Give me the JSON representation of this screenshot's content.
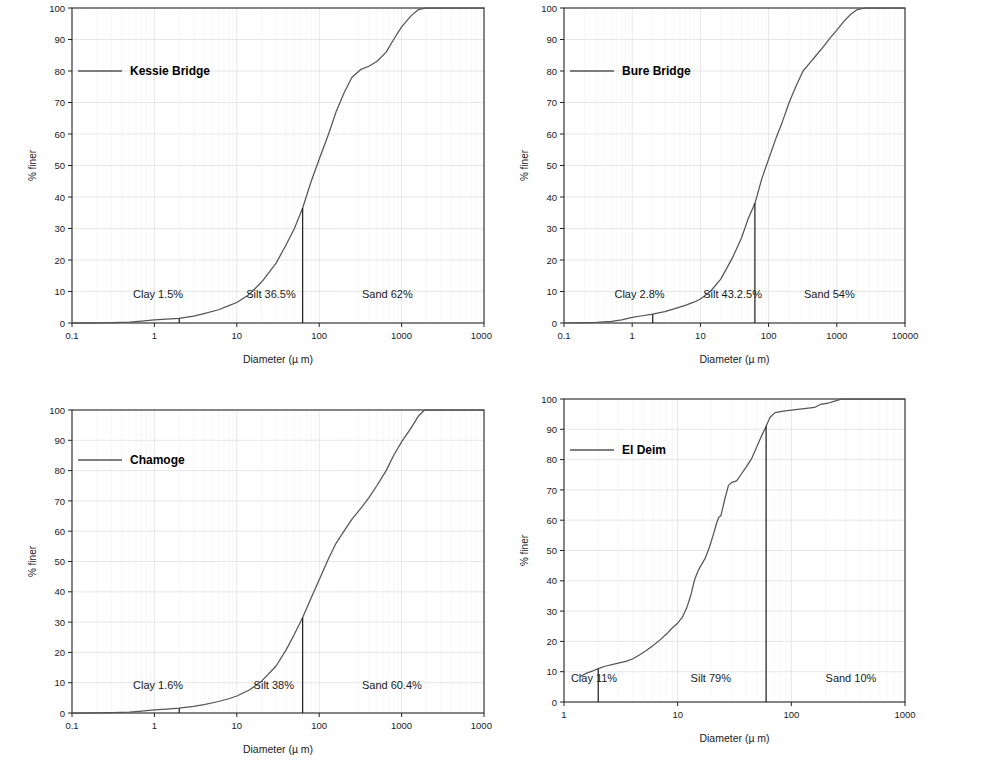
{
  "figure": {
    "background": "#ffffff",
    "line_color": "#555555",
    "axis_color": "#222222",
    "grid_color": "#dddddd",
    "text_color": "#1a1a1a",
    "panel_count": 4,
    "layout": "2x2"
  },
  "common": {
    "xlabel": "Diameter (µ m)",
    "ylabel": "% finer",
    "yticks": [
      0,
      10,
      20,
      30,
      40,
      50,
      60,
      70,
      80,
      90,
      100
    ],
    "ylim": [
      0,
      100
    ],
    "grid": true,
    "legend_position": "upper-left-inside"
  },
  "chart_data": [
    {
      "type": "line",
      "id": "kessie-bridge",
      "title": "",
      "legend": [
        "Kessie Bridge"
      ],
      "xlabel": "Diameter (µ m)",
      "ylabel": "% finer",
      "xscale": "log",
      "xlim": [
        0.1,
        10000
      ],
      "xticks": [
        0.1,
        1,
        10,
        100,
        1000,
        10000
      ],
      "xticklabels": [
        "0.1",
        "1",
        "10",
        "100",
        "1000",
        "10000"
      ],
      "ylim": [
        0,
        100
      ],
      "yticks": [
        0,
        10,
        20,
        30,
        40,
        50,
        60,
        70,
        80,
        90,
        100
      ],
      "fractions": {
        "clay": "Clay 1.5%",
        "silt": "Silt 36.5%",
        "sand": "Sand 62%",
        "clay_pct": 1.5,
        "silt_pct": 36.5,
        "sand_pct": 62
      },
      "dividers": [
        {
          "x": 2,
          "y_top": 1.5,
          "label": "clay-silt boundary"
        },
        {
          "x": 63,
          "y_top": 36.5,
          "label": "silt-sand boundary"
        }
      ],
      "series": [
        {
          "name": "Kessie Bridge",
          "points": [
            [
              0.1,
              0.0
            ],
            [
              0.2,
              0.05
            ],
            [
              0.3,
              0.1
            ],
            [
              0.5,
              0.3
            ],
            [
              0.7,
              0.6
            ],
            [
              1.0,
              1.0
            ],
            [
              1.4,
              1.2
            ],
            [
              2.0,
              1.5
            ],
            [
              3.0,
              2.2
            ],
            [
              4.0,
              3.0
            ],
            [
              6.0,
              4.2
            ],
            [
              8.0,
              5.5
            ],
            [
              10.0,
              6.5
            ],
            [
              14.0,
              9.0
            ],
            [
              20.0,
              13.0
            ],
            [
              30.0,
              19.0
            ],
            [
              40.0,
              25.0
            ],
            [
              50.0,
              30.0
            ],
            [
              63.0,
              36.5
            ],
            [
              80.0,
              45.0
            ],
            [
              100.0,
              52.0
            ],
            [
              130.0,
              60.0
            ],
            [
              160.0,
              67.0
            ],
            [
              200.0,
              73.0
            ],
            [
              250.0,
              78.0
            ],
            [
              320.0,
              80.5
            ],
            [
              400.0,
              81.5
            ],
            [
              500.0,
              83.0
            ],
            [
              650.0,
              86.0
            ],
            [
              800.0,
              90.0
            ],
            [
              1000.0,
              94.0
            ],
            [
              1300.0,
              97.5
            ],
            [
              1600.0,
              99.5
            ],
            [
              2000.0,
              100.0
            ],
            [
              10000.0,
              100.0
            ]
          ]
        }
      ]
    },
    {
      "type": "line",
      "id": "bure-bridge",
      "title": "",
      "legend": [
        "Bure Bridge"
      ],
      "xlabel": "Diameter (µ m)",
      "ylabel": "% finer",
      "xscale": "log",
      "xlim": [
        0.1,
        10000
      ],
      "xticks": [
        0.1,
        1,
        10,
        100,
        1000,
        10000
      ],
      "xticklabels": [
        "0.1",
        "1",
        "10",
        "100",
        "1000",
        "10000"
      ],
      "ylim": [
        0,
        100
      ],
      "yticks": [
        0,
        10,
        20,
        30,
        40,
        50,
        60,
        70,
        80,
        90,
        100
      ],
      "fractions": {
        "clay": "Clay 2.8%",
        "silt": "Silt 43.2.5%",
        "sand": "Sand 54%",
        "clay_pct": 2.8,
        "silt_pct": 43.25,
        "sand_pct": 54
      },
      "dividers": [
        {
          "x": 2,
          "y_top": 2.8,
          "label": "clay-silt boundary"
        },
        {
          "x": 63,
          "y_top": 38.0,
          "label": "silt-sand boundary"
        }
      ],
      "series": [
        {
          "name": "Bure Bridge",
          "points": [
            [
              0.1,
              0.0
            ],
            [
              0.2,
              0.1
            ],
            [
              0.3,
              0.2
            ],
            [
              0.5,
              0.5
            ],
            [
              0.7,
              1.0
            ],
            [
              1.0,
              1.8
            ],
            [
              1.4,
              2.3
            ],
            [
              2.0,
              2.8
            ],
            [
              3.0,
              3.6
            ],
            [
              4.0,
              4.4
            ],
            [
              6.0,
              5.6
            ],
            [
              8.0,
              6.6
            ],
            [
              10.0,
              7.6
            ],
            [
              14.0,
              10.0
            ],
            [
              20.0,
              14.0
            ],
            [
              30.0,
              21.0
            ],
            [
              40.0,
              27.0
            ],
            [
              50.0,
              33.0
            ],
            [
              63.0,
              38.0
            ],
            [
              80.0,
              46.0
            ],
            [
              100.0,
              52.0
            ],
            [
              130.0,
              59.0
            ],
            [
              160.0,
              64.0
            ],
            [
              200.0,
              70.0
            ],
            [
              250.0,
              75.0
            ],
            [
              320.0,
              80.0
            ],
            [
              400.0,
              82.5
            ],
            [
              500.0,
              85.0
            ],
            [
              650.0,
              88.0
            ],
            [
              800.0,
              90.5
            ],
            [
              1000.0,
              93.0
            ],
            [
              1300.0,
              96.0
            ],
            [
              1600.0,
              98.0
            ],
            [
              2000.0,
              99.5
            ],
            [
              2600.0,
              100.0
            ],
            [
              10000.0,
              100.0
            ]
          ]
        }
      ]
    },
    {
      "type": "line",
      "id": "chamoge",
      "title": "",
      "legend": [
        "Chamoge"
      ],
      "xlabel": "Diameter (µ m)",
      "ylabel": "% finer",
      "xscale": "log",
      "xlim": [
        0.1,
        10000
      ],
      "xticks": [
        0.1,
        1,
        10,
        100,
        1000,
        10000
      ],
      "xticklabels": [
        "0.1",
        "1",
        "10",
        "100",
        "1000",
        "10000"
      ],
      "ylim": [
        0,
        100
      ],
      "yticks": [
        0,
        10,
        20,
        30,
        40,
        50,
        60,
        70,
        80,
        90,
        100
      ],
      "fractions": {
        "clay": "Clay 1.6%",
        "silt": "Silt 38%",
        "sand": "Sand 60.4%",
        "clay_pct": 1.6,
        "silt_pct": 38,
        "sand_pct": 60.4
      },
      "dividers": [
        {
          "x": 2,
          "y_top": 1.6,
          "label": "clay-silt boundary"
        },
        {
          "x": 63,
          "y_top": 31.5,
          "label": "silt-sand boundary"
        }
      ],
      "series": [
        {
          "name": "Chamoge",
          "points": [
            [
              0.1,
              0.0
            ],
            [
              0.2,
              0.05
            ],
            [
              0.3,
              0.1
            ],
            [
              0.5,
              0.25
            ],
            [
              0.7,
              0.6
            ],
            [
              1.0,
              1.0
            ],
            [
              1.4,
              1.3
            ],
            [
              2.0,
              1.6
            ],
            [
              3.0,
              2.2
            ],
            [
              4.0,
              2.8
            ],
            [
              6.0,
              3.8
            ],
            [
              8.0,
              4.7
            ],
            [
              10.0,
              5.6
            ],
            [
              14.0,
              7.5
            ],
            [
              20.0,
              10.5
            ],
            [
              30.0,
              15.5
            ],
            [
              40.0,
              21.0
            ],
            [
              50.0,
              26.0
            ],
            [
              63.0,
              31.5
            ],
            [
              80.0,
              38.0
            ],
            [
              100.0,
              44.0
            ],
            [
              130.0,
              51.0
            ],
            [
              160.0,
              56.0
            ],
            [
              200.0,
              60.0
            ],
            [
              250.0,
              64.0
            ],
            [
              320.0,
              67.5
            ],
            [
              400.0,
              71.0
            ],
            [
              500.0,
              75.0
            ],
            [
              650.0,
              80.0
            ],
            [
              800.0,
              85.0
            ],
            [
              1000.0,
              89.5
            ],
            [
              1300.0,
              94.0
            ],
            [
              1600.0,
              98.0
            ],
            [
              1900.0,
              100.0
            ],
            [
              10000.0,
              100.0
            ]
          ]
        }
      ]
    },
    {
      "type": "line",
      "id": "el-deim",
      "title": "",
      "legend": [
        "El Deim"
      ],
      "xlabel": "Diameter (µ m)",
      "ylabel": "% finer",
      "xscale": "log",
      "xlim": [
        1,
        1000
      ],
      "xticks": [
        1,
        10,
        100,
        1000
      ],
      "xticklabels": [
        "1",
        "10",
        "100",
        "1000"
      ],
      "ylim": [
        0,
        100
      ],
      "yticks": [
        0,
        10,
        20,
        30,
        40,
        50,
        60,
        70,
        80,
        90,
        100
      ],
      "fractions": {
        "clay": "Clay 11%",
        "silt": "Silt 79%",
        "sand": "Sand 10%",
        "clay_pct": 11,
        "silt_pct": 79,
        "sand_pct": 10
      },
      "dividers": [
        {
          "x": 2,
          "y_top": 11.0,
          "label": "clay-silt boundary"
        },
        {
          "x": 60,
          "y_top": 91.0,
          "label": "silt-sand boundary"
        }
      ],
      "series": [
        {
          "name": "El Deim",
          "points": [
            [
              1.4,
              8.5
            ],
            [
              1.6,
              9.6
            ],
            [
              1.8,
              10.3
            ],
            [
              2.0,
              11.0
            ],
            [
              2.3,
              11.8
            ],
            [
              2.7,
              12.4
            ],
            [
              3.0,
              12.8
            ],
            [
              3.5,
              13.4
            ],
            [
              4.0,
              14.2
            ],
            [
              4.6,
              15.5
            ],
            [
              5.3,
              17.0
            ],
            [
              6.0,
              18.5
            ],
            [
              7.0,
              20.5
            ],
            [
              8.0,
              22.5
            ],
            [
              9.0,
              24.5
            ],
            [
              10.0,
              26.0
            ],
            [
              11.0,
              28.0
            ],
            [
              12.0,
              31.0
            ],
            [
              13.0,
              35.0
            ],
            [
              14.0,
              40.0
            ],
            [
              15.0,
              43.0
            ],
            [
              16.0,
              45.0
            ],
            [
              17.5,
              47.5
            ],
            [
              19.0,
              51.0
            ],
            [
              20.5,
              55.0
            ],
            [
              22.0,
              59.0
            ],
            [
              23.0,
              61.0
            ],
            [
              24.0,
              61.5
            ],
            [
              26.0,
              67.0
            ],
            [
              28.0,
              71.5
            ],
            [
              30.0,
              72.5
            ],
            [
              33.0,
              73.0
            ],
            [
              36.0,
              75.0
            ],
            [
              40.0,
              77.5
            ],
            [
              45.0,
              80.5
            ],
            [
              50.0,
              84.5
            ],
            [
              55.0,
              88.0
            ],
            [
              60.0,
              91.0
            ],
            [
              65.0,
              94.0
            ],
            [
              72.0,
              95.5
            ],
            [
              85.0,
              96.0
            ],
            [
              100.0,
              96.3
            ],
            [
              130.0,
              96.8
            ],
            [
              160.0,
              97.2
            ],
            [
              180.0,
              98.2
            ],
            [
              210.0,
              98.6
            ],
            [
              240.0,
              99.3
            ],
            [
              280.0,
              100.0
            ],
            [
              1000.0,
              100.0
            ]
          ]
        }
      ]
    }
  ]
}
